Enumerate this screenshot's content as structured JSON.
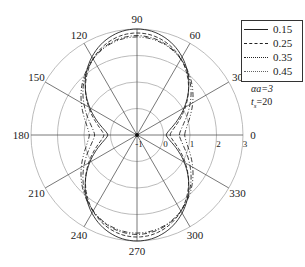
{
  "chart_data": {
    "type": "polar-line",
    "title": "",
    "angular_ticks": [
      "0",
      "30",
      "60",
      "90",
      "120",
      "150",
      "180",
      "210",
      "240",
      "270",
      "300",
      "330"
    ],
    "radial_ticks": [
      "-1",
      "0",
      "1",
      "2",
      "3"
    ],
    "radial_range": [
      -1,
      3
    ],
    "grid": true,
    "legend_position": "upper-right",
    "annotations": [
      "αa=3",
      "t_s=20"
    ],
    "series": [
      {
        "name": "0.15",
        "style": "solid",
        "r_at_0deg": 0.1,
        "r_at_90deg": 3.0
      },
      {
        "name": "0.25",
        "style": "dashed",
        "r_at_0deg": 0.25,
        "r_at_90deg": 2.85
      },
      {
        "name": "0.35",
        "style": "dashdot",
        "r_at_0deg": 0.6,
        "r_at_90deg": 2.75
      },
      {
        "name": "0.45",
        "style": "dashdotdot",
        "r_at_0deg": 0.8,
        "r_at_90deg": 2.7
      }
    ]
  },
  "legend": {
    "items": [
      {
        "label": "0.15"
      },
      {
        "label": "0.25"
      },
      {
        "label": "0.35"
      },
      {
        "label": "0.45"
      }
    ]
  },
  "params": {
    "aa": "αa=3",
    "ts": "t",
    "ts_sub": "s",
    "ts_val": "=20"
  }
}
